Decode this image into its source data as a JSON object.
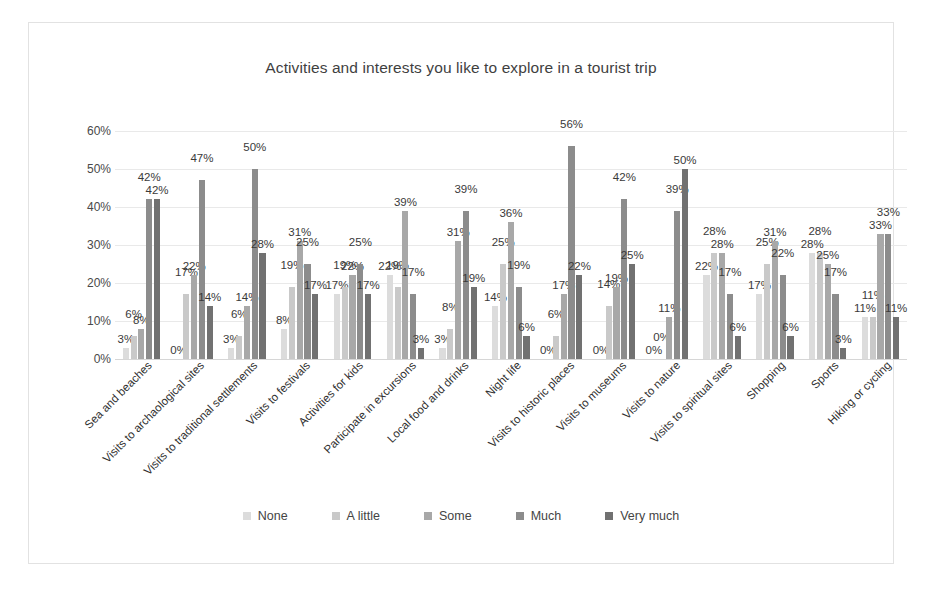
{
  "chart_data": {
    "type": "bar",
    "title": "Activities and interests you like to explore in a tourist trip",
    "xlabel": "",
    "ylabel": "",
    "ylim": [
      0,
      60
    ],
    "ytick_labels": [
      "0%",
      "10%",
      "20%",
      "30%",
      "40%",
      "50%",
      "60%"
    ],
    "ytick_values": [
      0,
      10,
      20,
      30,
      40,
      50,
      60
    ],
    "grid": true,
    "legend_position": "bottom",
    "value_suffix": "%",
    "categories": [
      "Sea and beaches",
      "Visits to archaological sites",
      "Visits to traditional settlements",
      "Visits to festivals",
      "Activities for kids",
      "Participate in excursions",
      "Local food and drinks",
      "Night life",
      "Visits to historic places",
      "Visits to museums",
      "Visits to nature",
      "Visits to spiritual sites",
      "Shopping",
      "Sports",
      "Hiking or cycling"
    ],
    "series": [
      {
        "name": "None",
        "color": "#dcdcdc",
        "values": [
          3,
          0,
          3,
          8,
          17,
          22,
          3,
          14,
          0,
          0,
          0,
          22,
          17,
          28,
          11
        ]
      },
      {
        "name": "A little",
        "color": "#c9c9c9",
        "values": [
          6,
          17,
          6,
          19,
          19,
          19,
          8,
          25,
          6,
          14,
          0,
          28,
          25,
          28,
          11
        ]
      },
      {
        "name": "Some",
        "color": "#a8a8a8",
        "values": [
          8,
          22,
          14,
          31,
          22,
          39,
          31,
          36,
          17,
          19,
          11,
          28,
          31,
          25,
          33
        ]
      },
      {
        "name": "Much",
        "color": "#8c8c8c",
        "values": [
          42,
          47,
          50,
          25,
          25,
          17,
          39,
          19,
          56,
          42,
          39,
          17,
          22,
          17,
          33
        ]
      },
      {
        "name": "Very much",
        "color": "#717171",
        "values": [
          42,
          14,
          28,
          17,
          17,
          3,
          19,
          6,
          22,
          25,
          50,
          6,
          6,
          3,
          11
        ]
      }
    ]
  },
  "legend": {
    "items": [
      "None",
      "A little",
      "Some",
      "Much",
      "Very much"
    ]
  }
}
